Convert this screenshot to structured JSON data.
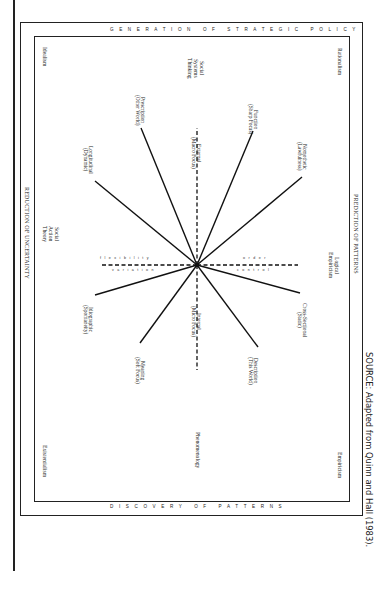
{
  "frame_titles": {
    "top": "GENERATION OF STRATEGIC POLICY",
    "bottom": "DISCOVERY OF PATTERNS",
    "left": "REDUCTION OF UNCERTAINTY",
    "right": "PREDICTION OF PATTERNS"
  },
  "corners": {
    "top_left": "Idealism",
    "top_right": "Rationalism",
    "bottom_left": "Existentialism",
    "bottom_right": "Empiricism"
  },
  "edge_middles": {
    "top": [
      "Social",
      "Systems",
      "Thinking"
    ],
    "left": [
      "Social",
      "Action",
      "Theory"
    ],
    "bottom": "Phenomenology",
    "right": [
      "Logical",
      "Empiricism"
    ]
  },
  "spokes": [
    {
      "id": "prescription",
      "line1": "Prescription",
      "line2": "(Other World)",
      "dx": -56,
      "dy": -137
    },
    {
      "id": "function",
      "line1": "Function",
      "line2": "(Sharp Focus)",
      "dx": 56,
      "dy": -134
    },
    {
      "id": "longitudinal",
      "line1": "Longitudinal",
      "line2": "(Dynamic)",
      "dx": -102,
      "dy": -84
    },
    {
      "id": "nomothetic",
      "line1": "Nomothetic",
      "line2": "(Lawfulness)",
      "dx": 105,
      "dy": -88
    },
    {
      "id": "idiographic",
      "line1": "Idiographic",
      "line2": "(Spontaneity)",
      "dx": -102,
      "dy": 30
    },
    {
      "id": "cross-sectional",
      "line1": "Cross-Sectional",
      "line2": "(Static)",
      "dx": 103,
      "dy": 28
    },
    {
      "id": "meaning",
      "line1": "Meaning",
      "line2": "(Soft Focus)",
      "dx": -57,
      "dy": 78
    },
    {
      "id": "description",
      "line1": "Description",
      "line2": "(This World)",
      "dx": 61,
      "dy": 82
    }
  ],
  "dashed_axes": {
    "external": {
      "line1": "External",
      "line2": "(Macro Focus)"
    },
    "internal": {
      "line1": "Internal",
      "line2": "(Micro Focus)"
    },
    "left_upper": "flexibility",
    "left_lower": "variation",
    "right_upper": "order",
    "right_lower": "control"
  },
  "source": "SOURCE:  Adapted from Quinn and Hall (1983)."
}
